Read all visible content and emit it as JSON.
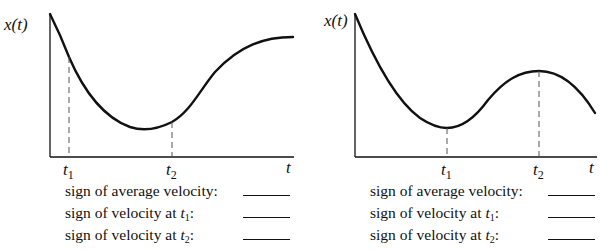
{
  "panels": [
    {
      "y_axis_label": "x(t)",
      "x_axis_label": "t",
      "markers": [
        {
          "name": "t",
          "sub": "1"
        },
        {
          "name": "t",
          "sub": "2"
        }
      ],
      "questions": [
        {
          "text": "sign of average velocity:",
          "var": "",
          "sub": "",
          "tail": ""
        },
        {
          "text": "sign of velocity at ",
          "var": "t",
          "sub": "1",
          "tail": ":"
        },
        {
          "text": "sign of velocity at ",
          "var": "t",
          "sub": "2",
          "tail": ":"
        }
      ]
    },
    {
      "y_axis_label": "x(t)",
      "x_axis_label": "t",
      "markers": [
        {
          "name": "t",
          "sub": "1"
        },
        {
          "name": "t",
          "sub": "2"
        }
      ],
      "questions": [
        {
          "text": "sign of average velocity:",
          "var": "",
          "sub": "",
          "tail": ""
        },
        {
          "text": "sign of velocity at ",
          "var": "t",
          "sub": "1",
          "tail": ":"
        },
        {
          "text": "sign of velocity at ",
          "var": "t",
          "sub": "2",
          "tail": ":"
        }
      ]
    }
  ],
  "colors": {
    "ink": "#111111",
    "dash": "#555555",
    "background": "#ffffff"
  }
}
